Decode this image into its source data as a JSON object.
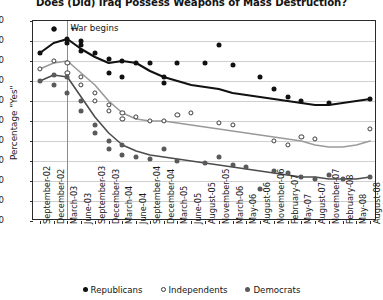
{
  "chart_data": {
    "type": "line",
    "title": "Does (Did) Iraq Possess Weapons of Mass Destruction?",
    "xlabel": "",
    "ylabel": "Percentage \"Yes\"",
    "ylim": [
      0,
      100
    ],
    "ytick_step": 10,
    "yticks": [
      0,
      10,
      20,
      30,
      40,
      50,
      60,
      70,
      80,
      90,
      100
    ],
    "grid": true,
    "legend_position": "bottom",
    "annotations": [
      {
        "text": "War begins",
        "arrow": "←",
        "at_category": "March-03",
        "value": 96
      }
    ],
    "categories": [
      "September-02",
      "December-02",
      "March-03",
      "June-03",
      "September-03",
      "December-03",
      "March-04",
      "June-04",
      "September-04",
      "December-04",
      "March-05",
      "June-05",
      "August-05",
      "November-05",
      "March-06",
      "May-06",
      "August-06",
      "November-06",
      "February-07",
      "May-07",
      "August-07",
      "November-07",
      "February-08",
      "May-08",
      "August-08"
    ],
    "series": [
      {
        "name": "Republicans",
        "marker": "filled-circle",
        "color": "#111111",
        "line_color": "#111111",
        "values": [
          84,
          89,
          91,
          86,
          82,
          79,
          80,
          79,
          75,
          72,
          70,
          68,
          67,
          66,
          64,
          63,
          62,
          61,
          60,
          59,
          58,
          58,
          59,
          60,
          61
        ],
        "points": [
          {
            "x": "September-02",
            "y": 84
          },
          {
            "x": "December-02",
            "y": 96
          },
          {
            "x": "December-02",
            "y": 96
          },
          {
            "x": "March-03",
            "y": 91
          },
          {
            "x": "March-03",
            "y": 89
          },
          {
            "x": "June-03",
            "y": 88
          },
          {
            "x": "June-03",
            "y": 85
          },
          {
            "x": "June-03",
            "y": 90
          },
          {
            "x": "September-03",
            "y": 84
          },
          {
            "x": "December-03",
            "y": 81
          },
          {
            "x": "December-03",
            "y": 74
          },
          {
            "x": "March-04",
            "y": 80
          },
          {
            "x": "March-04",
            "y": 72
          },
          {
            "x": "June-04",
            "y": 79
          },
          {
            "x": "September-04",
            "y": 79
          },
          {
            "x": "December-04",
            "y": 72
          },
          {
            "x": "December-04",
            "y": 69
          },
          {
            "x": "March-05",
            "y": 79
          },
          {
            "x": "August-05",
            "y": 79
          },
          {
            "x": "November-05",
            "y": 88
          },
          {
            "x": "March-06",
            "y": 78
          },
          {
            "x": "August-06",
            "y": 72
          },
          {
            "x": "November-06",
            "y": 66
          },
          {
            "x": "February-07",
            "y": 62
          },
          {
            "x": "May-07",
            "y": 60
          },
          {
            "x": "November-07",
            "y": 59
          },
          {
            "x": "August-08",
            "y": 61
          }
        ]
      },
      {
        "name": "Independents",
        "marker": "open-circle",
        "color": "#ffffff",
        "line_color": "#9a9a9a",
        "values": [
          76,
          79,
          80,
          74,
          68,
          60,
          54,
          51,
          50,
          50,
          49,
          48,
          47,
          46,
          45,
          44,
          43,
          42,
          41,
          40,
          38,
          37,
          37,
          38,
          40
        ],
        "points": [
          {
            "x": "September-02",
            "y": 76
          },
          {
            "x": "December-02",
            "y": 80
          },
          {
            "x": "March-03",
            "y": 79
          },
          {
            "x": "March-03",
            "y": 74
          },
          {
            "x": "June-03",
            "y": 72
          },
          {
            "x": "June-03",
            "y": 68
          },
          {
            "x": "September-03",
            "y": 64
          },
          {
            "x": "September-03",
            "y": 60
          },
          {
            "x": "December-03",
            "y": 58
          },
          {
            "x": "December-03",
            "y": 55
          },
          {
            "x": "March-04",
            "y": 54
          },
          {
            "x": "March-04",
            "y": 51
          },
          {
            "x": "June-04",
            "y": 52
          },
          {
            "x": "September-04",
            "y": 50
          },
          {
            "x": "December-04",
            "y": 50
          },
          {
            "x": "March-05",
            "y": 53
          },
          {
            "x": "June-05",
            "y": 54
          },
          {
            "x": "November-05",
            "y": 49
          },
          {
            "x": "March-06",
            "y": 48
          },
          {
            "x": "November-06",
            "y": 40
          },
          {
            "x": "February-07",
            "y": 38
          },
          {
            "x": "May-07",
            "y": 42
          },
          {
            "x": "August-07",
            "y": 41
          },
          {
            "x": "August-08",
            "y": 46
          }
        ]
      },
      {
        "name": "Democrats",
        "marker": "filled-circle-gray",
        "color": "#5a5a5a",
        "line_color": "#4d4d4d",
        "values": [
          70,
          73,
          72,
          62,
          52,
          44,
          38,
          35,
          33,
          32,
          31,
          30,
          29,
          28,
          27,
          26,
          25,
          24,
          23,
          22,
          22,
          21,
          21,
          21,
          22
        ],
        "points": [
          {
            "x": "September-02",
            "y": 70
          },
          {
            "x": "December-02",
            "y": 73
          },
          {
            "x": "December-02",
            "y": 68
          },
          {
            "x": "March-03",
            "y": 72
          },
          {
            "x": "March-03",
            "y": 64
          },
          {
            "x": "June-03",
            "y": 60
          },
          {
            "x": "June-03",
            "y": 55
          },
          {
            "x": "September-03",
            "y": 48
          },
          {
            "x": "September-03",
            "y": 44
          },
          {
            "x": "December-03",
            "y": 40
          },
          {
            "x": "December-03",
            "y": 36
          },
          {
            "x": "March-04",
            "y": 38
          },
          {
            "x": "March-04",
            "y": 33
          },
          {
            "x": "June-04",
            "y": 32
          },
          {
            "x": "September-04",
            "y": 31
          },
          {
            "x": "December-04",
            "y": 36
          },
          {
            "x": "March-05",
            "y": 30
          },
          {
            "x": "August-05",
            "y": 29
          },
          {
            "x": "November-05",
            "y": 32
          },
          {
            "x": "March-06",
            "y": 28
          },
          {
            "x": "May-06",
            "y": 27
          },
          {
            "x": "August-06",
            "y": 16
          },
          {
            "x": "November-06",
            "y": 25
          },
          {
            "x": "February-07",
            "y": 24
          },
          {
            "x": "May-07",
            "y": 22
          },
          {
            "x": "August-07",
            "y": 21
          },
          {
            "x": "November-07",
            "y": 23
          },
          {
            "x": "February-08",
            "y": 21
          },
          {
            "x": "August-08",
            "y": 22
          }
        ]
      }
    ]
  },
  "legend": {
    "items": [
      {
        "label": "Republicans",
        "marker": "rep"
      },
      {
        "label": "Independents",
        "marker": "ind"
      },
      {
        "label": "Democrats",
        "marker": "dem"
      }
    ]
  }
}
